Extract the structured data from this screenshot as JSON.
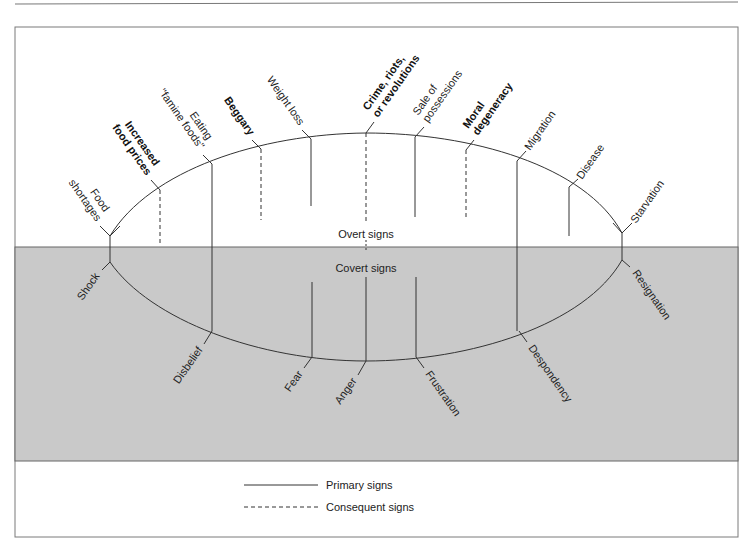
{
  "diagram": {
    "zones": {
      "overt_label": "Overt signs",
      "covert_label": "Covert signs"
    },
    "overt_signs": [
      {
        "label_lines": [
          "Food",
          "shortages"
        ],
        "bold": false,
        "type": "primary"
      },
      {
        "label_lines": [
          "Increased",
          "food prices"
        ],
        "bold": true,
        "type": "consequent"
      },
      {
        "label_lines": [
          "Eating",
          "\"famine foods\""
        ],
        "bold": false,
        "type": "primary"
      },
      {
        "label_lines": [
          "Beggary"
        ],
        "bold": true,
        "type": "consequent"
      },
      {
        "label_lines": [
          "Weight loss"
        ],
        "bold": false,
        "type": "primary"
      },
      {
        "label_lines": [
          "Crime, riots,",
          "or revolutions"
        ],
        "bold": true,
        "type": "consequent"
      },
      {
        "label_lines": [
          "Sale of",
          "possessions"
        ],
        "bold": false,
        "type": "primary"
      },
      {
        "label_lines": [
          "Moral",
          "degeneracy"
        ],
        "bold": true,
        "type": "consequent"
      },
      {
        "label_lines": [
          "Migration"
        ],
        "bold": false,
        "type": "primary"
      },
      {
        "label_lines": [
          "Disease"
        ],
        "bold": false,
        "type": "primary"
      },
      {
        "label_lines": [
          "Starvation"
        ],
        "bold": false,
        "type": "primary"
      }
    ],
    "covert_signs": [
      {
        "label": "Shock"
      },
      {
        "label": "Disbelief"
      },
      {
        "label": "Fear"
      },
      {
        "label": "Anger"
      },
      {
        "label": "Frustration"
      },
      {
        "label": "Despondency"
      },
      {
        "label": "Resignation"
      }
    ],
    "legend": {
      "primary_label": "Primary signs",
      "consequent_label": "Consequent signs"
    },
    "colors": {
      "covert_band": "#c9c9c9",
      "line": "#333333",
      "frame": "#777777"
    }
  }
}
